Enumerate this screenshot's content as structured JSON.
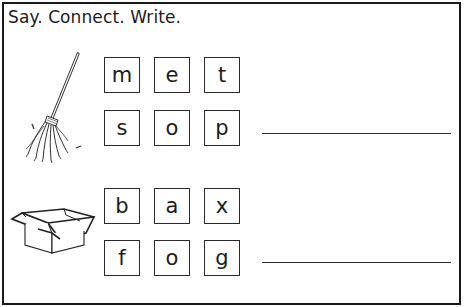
{
  "worksheet": {
    "instruction": "Say. Connect. Write.",
    "border_color": "#1a1a1a",
    "items": [
      {
        "picture": "mop-icon",
        "picture_label": "mop",
        "rows": [
          [
            "m",
            "e",
            "t"
          ],
          [
            "s",
            "o",
            "p"
          ]
        ],
        "answer_line": ""
      },
      {
        "picture": "box-icon",
        "picture_label": "box",
        "rows": [
          [
            "b",
            "a",
            "x"
          ],
          [
            "f",
            "o",
            "g"
          ]
        ],
        "answer_line": ""
      }
    ]
  }
}
